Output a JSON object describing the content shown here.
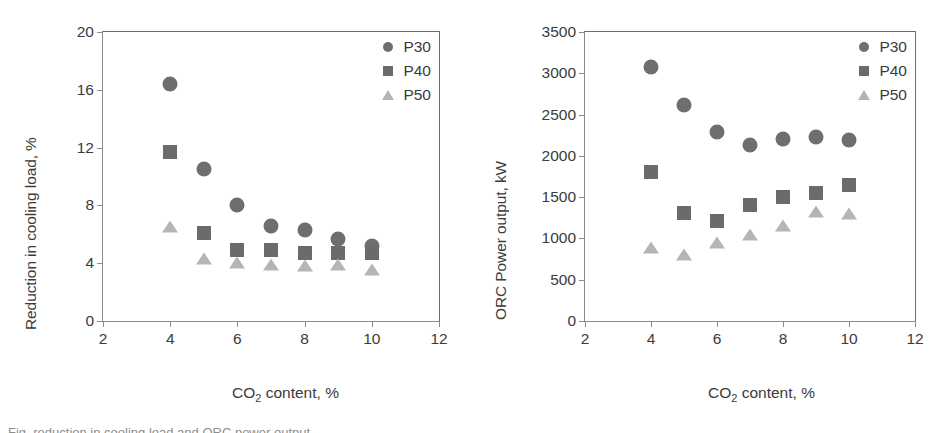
{
  "figure": {
    "width": 951,
    "height": 433,
    "background": "#ffffff",
    "caption_partial": "Fig. reduction in cooling load and ORC power output"
  },
  "style": {
    "color_p30": "#6e6e6e",
    "color_p40": "#6b6b6b",
    "color_p50": "#b5b5b5",
    "axis_color": "#8a8a8a",
    "text_color": "#3b3b3b"
  },
  "chart_data": [
    {
      "id": "left",
      "type": "scatter",
      "title": "",
      "xlabel": "CO2 content, %",
      "xlabel_prefix": "CO",
      "xlabel_sub": "2",
      "xlabel_suffix": " content, %",
      "ylabel": "Reduction in cooling load, %",
      "xlim": [
        2,
        12
      ],
      "ylim": [
        0,
        20
      ],
      "xticks": [
        2,
        4,
        6,
        8,
        10,
        12
      ],
      "yticks": [
        0,
        4,
        8,
        12,
        16,
        20
      ],
      "grid": false,
      "legend_position": "top-right",
      "x": [
        4,
        5,
        6,
        7,
        8,
        9,
        10
      ],
      "series": [
        {
          "name": "P30",
          "marker": "circle",
          "color": "#6e6e6e",
          "values": [
            16.4,
            10.5,
            8.0,
            6.6,
            6.3,
            5.7,
            5.2
          ]
        },
        {
          "name": "P40",
          "marker": "square",
          "color": "#6b6b6b",
          "values": [
            11.7,
            6.1,
            4.9,
            4.9,
            4.7,
            4.7,
            4.7
          ]
        },
        {
          "name": "P50",
          "marker": "triangle",
          "color": "#b5b5b5",
          "values": [
            6.5,
            4.3,
            4.0,
            3.9,
            3.8,
            3.9,
            3.5
          ]
        }
      ]
    },
    {
      "id": "right",
      "type": "scatter",
      "title": "",
      "xlabel": "CO2 content, %",
      "xlabel_prefix": "CO",
      "xlabel_sub": "2",
      "xlabel_suffix": " content, %",
      "ylabel": "ORC Power output, kW",
      "xlim": [
        2,
        12
      ],
      "ylim": [
        0,
        3500
      ],
      "xticks": [
        2,
        4,
        6,
        8,
        10,
        12
      ],
      "yticks": [
        0,
        500,
        1000,
        1500,
        2000,
        2500,
        3000,
        3500
      ],
      "grid": false,
      "legend_position": "top-right",
      "x": [
        4,
        5,
        6,
        7,
        8,
        9,
        10
      ],
      "series": [
        {
          "name": "P30",
          "marker": "circle",
          "color": "#6e6e6e",
          "values": [
            3080,
            2620,
            2290,
            2130,
            2200,
            2230,
            2195
          ]
        },
        {
          "name": "P40",
          "marker": "square",
          "color": "#6b6b6b",
          "values": [
            1800,
            1310,
            1215,
            1400,
            1500,
            1550,
            1650
          ]
        },
        {
          "name": "P50",
          "marker": "triangle",
          "color": "#b5b5b5",
          "values": [
            880,
            800,
            940,
            1040,
            1145,
            1320,
            1300
          ]
        }
      ]
    }
  ]
}
